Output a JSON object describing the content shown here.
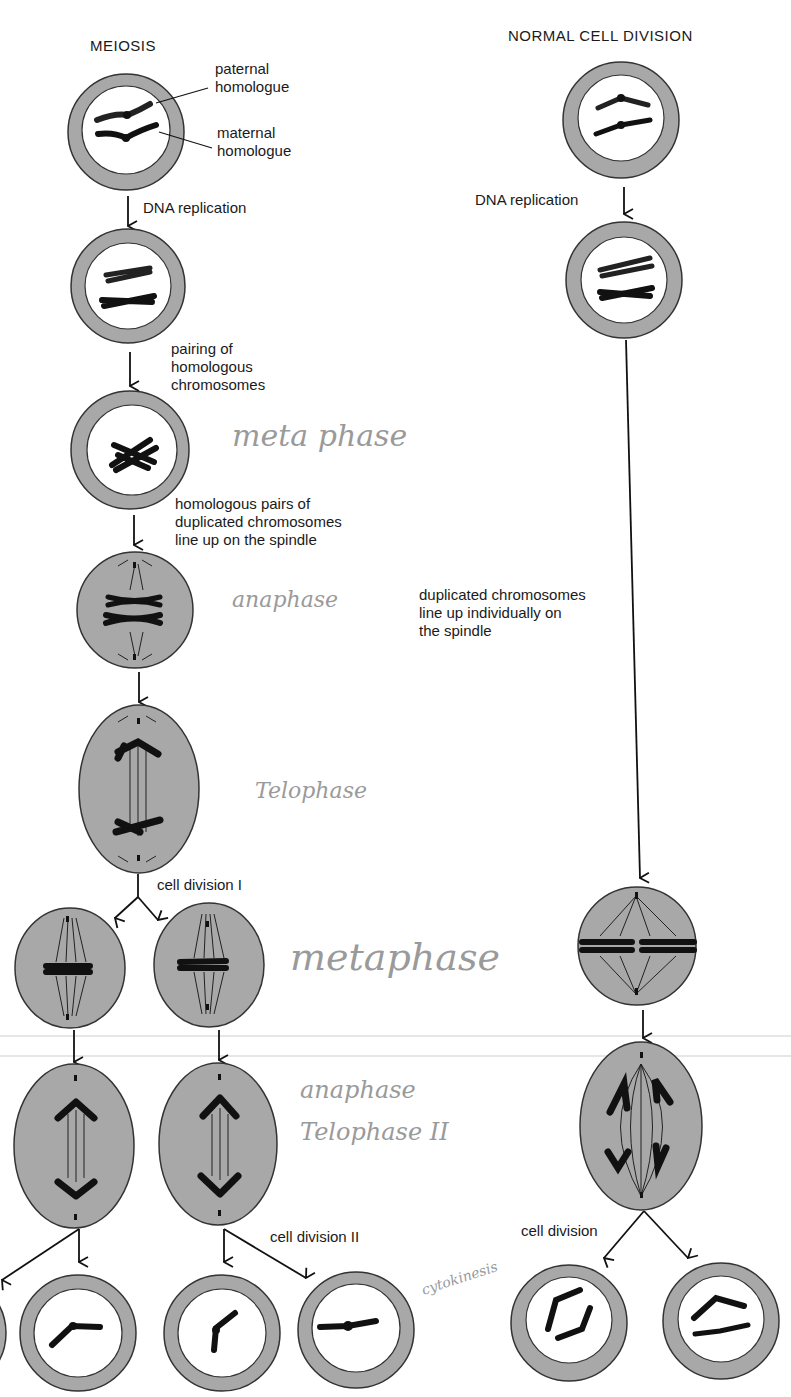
{
  "colors": {
    "cytoplasm": "#a8a8a8",
    "nucleus": "#ffffff",
    "chromosome": "#111111",
    "outline": "#333333",
    "text": "#1a1a1a",
    "handwriting": "#9a9a9a"
  },
  "meiosis": {
    "title": "MEIOSIS",
    "labels": {
      "paternal": "paternal\nhomologue",
      "maternal": "maternal\nhomologue",
      "dna_replication": "DNA replication",
      "pairing": "pairing of\nhomologous\nchromosomes",
      "line_up": "homologous pairs of\nduplicated chromosomes\nline up on the spindle",
      "cell_division_1": "cell division I",
      "cell_division_2": "cell division II"
    }
  },
  "normal": {
    "title": "NORMAL CELL DIVISION",
    "labels": {
      "dna_replication": "DNA replication",
      "line_up": "duplicated chromosomes\nline up individually on\nthe spindle",
      "cell_division": "cell division"
    }
  },
  "handwritten": {
    "metaphase_1": "meta phase",
    "anaphase_1": "anaphase",
    "telophase_1": "Telophase",
    "metaphase_2": "metaphase",
    "anaphase_2": "anaphase",
    "telophase_2": "Telophase II",
    "cytokinesis": "cytokinesis"
  }
}
